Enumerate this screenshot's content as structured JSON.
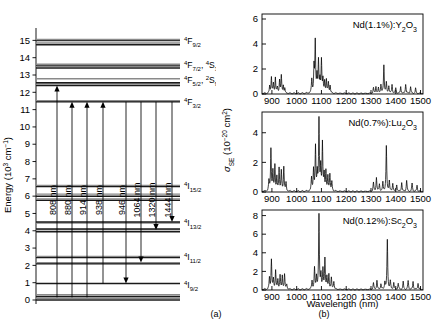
{
  "figure": {
    "panel_a_caption": "(a)",
    "panel_b_caption": "(b)"
  },
  "panel_a": {
    "name": "nd-energy-level-diagram",
    "ylabel": "Energy (10³ cm⁻¹)",
    "ylim": [
      0,
      15.6
    ],
    "yticks": [
      0,
      1,
      2,
      3,
      4,
      5,
      6,
      7,
      8,
      9,
      10,
      11,
      12,
      13,
      14,
      15
    ],
    "manifolds": [
      {
        "label": "⁴F₉₁₂",
        "label_text": "4F9/2",
        "sup": "4",
        "term": "F",
        "sub": "9/2",
        "levels": [
          14.75,
          14.85,
          15.0,
          15.05
        ]
      },
      {
        "label": "4F7/2, 4S3/2",
        "sup": "4",
        "term": "F",
        "sub": "7/2",
        "sup2": "4",
        "term2": "S",
        "sub2": "3/2",
        "levels": [
          13.4,
          13.5,
          13.58,
          13.62
        ]
      },
      {
        "label": "4F5/2, 2S9/2",
        "sup": "4",
        "term": "F",
        "sub": "5/2",
        "sup2": "2",
        "term2": "S",
        "sub2": "9/2",
        "levels": [
          12.4,
          12.48,
          12.55,
          12.78
        ]
      },
      {
        "label": "4F3/2",
        "sup": "4",
        "term": "F",
        "sub": "3/2",
        "levels": [
          11.45,
          11.52
        ]
      },
      {
        "label": "4I15/2",
        "sup": "4",
        "term": "I",
        "sub": "15/2",
        "levels": [
          5.76,
          5.84,
          6.0,
          6.12,
          6.56,
          6.62
        ]
      },
      {
        "label": "4I13/2",
        "sup": "4",
        "term": "I",
        "sub": "13/2",
        "levels": [
          3.95,
          4.05,
          4.1,
          4.45,
          4.5
        ]
      },
      {
        "label": "4I11/2",
        "sup": "4",
        "term": "I",
        "sub": "11/2",
        "levels": [
          2.1,
          2.16,
          2.45,
          2.52
        ]
      },
      {
        "label": "4I9/2",
        "sup": "4",
        "term": "I",
        "sub": "9/2",
        "levels": [
          0.0,
          0.1,
          0.2,
          0.3,
          0.95
        ]
      }
    ],
    "transitions": [
      {
        "label": "808 nm",
        "direction": "up",
        "x": 57,
        "from": 0.15,
        "to": 12.4
      },
      {
        "label": "880 nm",
        "direction": "up",
        "x": 72,
        "from": 0.15,
        "to": 11.45
      },
      {
        "label": "914 nm",
        "direction": "up",
        "x": 87,
        "from": 0.15,
        "to": 11.45
      },
      {
        "label": "938 nm",
        "direction": "up",
        "x": 103,
        "from": 0.95,
        "to": 11.45
      },
      {
        "label": "946 nm",
        "direction": "down",
        "x": 126,
        "from": 11.45,
        "to": 0.95
      },
      {
        "label": "1064 nm",
        "direction": "down",
        "x": 141,
        "from": 11.45,
        "to": 2.16
      },
      {
        "label": "1320 nm",
        "direction": "down",
        "x": 156,
        "from": 11.45,
        "to": 4.05
      },
      {
        "label": "1444 nm",
        "direction": "down",
        "x": 172,
        "from": 11.45,
        "to": 4.5
      }
    ]
  },
  "panel_b": {
    "name": "emission-cross-section-spectra",
    "xlabel": "Wavelength (nm)",
    "ylabel": "σ_SE (10⁻²⁰ cm²)",
    "ylabel_parts": {
      "sym": "σ",
      "sub": "SE",
      "unit_pre": " (10",
      "unit_exp": "−20",
      "unit_post": " cm",
      "unit_sq": "2",
      "unit_close": ")"
    },
    "xlim": [
      860,
      1510
    ],
    "xticks": [
      900,
      1000,
      1100,
      1200,
      1300,
      1400,
      1500
    ],
    "subplots": [
      {
        "name": "spectrum-y2o3",
        "title": "Nd(1.1%):Y₂O₃",
        "title_parts": [
          {
            "t": "Nd(1.1%):Y"
          },
          {
            "t": "2",
            "sub": true
          },
          {
            "t": "O"
          },
          {
            "t": "3",
            "sub": true
          }
        ],
        "ylim": [
          0,
          6.4
        ],
        "yticks": [
          0,
          2,
          4,
          6
        ]
      },
      {
        "name": "spectrum-lu2o3",
        "title": "Nd(0.7%):Lu₂O₃",
        "title_parts": [
          {
            "t": "Nd(0.7%):Lu"
          },
          {
            "t": "2",
            "sub": true
          },
          {
            "t": "O"
          },
          {
            "t": "3",
            "sub": true
          }
        ],
        "ylim": [
          0,
          5.4
        ],
        "yticks": [
          0,
          2,
          4
        ]
      },
      {
        "name": "spectrum-sc2o3",
        "title": "Nd(0.12%):Sc₂O₃",
        "title_parts": [
          {
            "t": "Nd(0.12%):Sc"
          },
          {
            "t": "2",
            "sub": true
          },
          {
            "t": "O"
          },
          {
            "t": "3",
            "sub": true
          }
        ],
        "ylim": [
          0,
          8.6
        ],
        "yticks": [
          0,
          2,
          4,
          6,
          8
        ]
      }
    ]
  },
  "chart_data": [
    {
      "type": "line",
      "name": "Nd(1.1%):Y2O3 stimulated emission cross section",
      "title": "Nd(1.1%):Y2O3",
      "xlabel": "Wavelength (nm)",
      "ylabel": "sigma_SE (10^-20 cm^2)",
      "xlim": [
        860,
        1510
      ],
      "ylim": [
        0,
        6.4
      ],
      "xticks": [
        900,
        1000,
        1100,
        1200,
        1300,
        1400,
        1500
      ],
      "yticks": [
        0,
        2,
        4,
        6
      ],
      "peaks": [
        {
          "x": 891,
          "y": 0.55
        },
        {
          "x": 898,
          "y": 1.3
        },
        {
          "x": 906,
          "y": 0.75
        },
        {
          "x": 914,
          "y": 1.25
        },
        {
          "x": 922,
          "y": 0.45
        },
        {
          "x": 931,
          "y": 1.05
        },
        {
          "x": 938,
          "y": 1.4
        },
        {
          "x": 946,
          "y": 0.6
        },
        {
          "x": 952,
          "y": 0.35
        },
        {
          "x": 1061,
          "y": 1.1
        },
        {
          "x": 1070,
          "y": 2.05
        },
        {
          "x": 1075,
          "y": 4.0
        },
        {
          "x": 1082,
          "y": 1.35
        },
        {
          "x": 1088,
          "y": 2.55
        },
        {
          "x": 1094,
          "y": 1.0
        },
        {
          "x": 1100,
          "y": 2.65
        },
        {
          "x": 1106,
          "y": 1.05
        },
        {
          "x": 1113,
          "y": 0.9
        },
        {
          "x": 1120,
          "y": 1.05
        },
        {
          "x": 1128,
          "y": 0.85
        },
        {
          "x": 1135,
          "y": 0.6
        },
        {
          "x": 1310,
          "y": 0.45
        },
        {
          "x": 1320,
          "y": 0.55
        },
        {
          "x": 1330,
          "y": 0.4
        },
        {
          "x": 1340,
          "y": 0.7
        },
        {
          "x": 1352,
          "y": 2.25
        },
        {
          "x": 1362,
          "y": 0.85
        },
        {
          "x": 1372,
          "y": 0.6
        },
        {
          "x": 1385,
          "y": 0.7
        },
        {
          "x": 1400,
          "y": 0.45
        },
        {
          "x": 1420,
          "y": 0.55
        },
        {
          "x": 1440,
          "y": 0.75
        },
        {
          "x": 1460,
          "y": 0.55
        },
        {
          "x": 1480,
          "y": 0.4
        }
      ]
    },
    {
      "type": "line",
      "name": "Nd(0.7%):Lu2O3 stimulated emission cross section",
      "title": "Nd(0.7%):Lu2O3",
      "xlabel": "Wavelength (nm)",
      "ylabel": "sigma_SE (10^-20 cm^2)",
      "xlim": [
        860,
        1510
      ],
      "ylim": [
        0,
        5.4
      ],
      "xticks": [
        900,
        1000,
        1100,
        1200,
        1300,
        1400,
        1500
      ],
      "yticks": [
        0,
        2,
        4
      ],
      "peaks": [
        {
          "x": 888,
          "y": 0.7
        },
        {
          "x": 896,
          "y": 2.85
        },
        {
          "x": 904,
          "y": 1.3
        },
        {
          "x": 912,
          "y": 1.75
        },
        {
          "x": 920,
          "y": 0.9
        },
        {
          "x": 929,
          "y": 1.55
        },
        {
          "x": 938,
          "y": 1.35
        },
        {
          "x": 948,
          "y": 1.65
        },
        {
          "x": 957,
          "y": 0.55
        },
        {
          "x": 1060,
          "y": 0.9
        },
        {
          "x": 1068,
          "y": 1.45
        },
        {
          "x": 1076,
          "y": 2.95
        },
        {
          "x": 1083,
          "y": 1.2
        },
        {
          "x": 1090,
          "y": 4.75
        },
        {
          "x": 1097,
          "y": 1.55
        },
        {
          "x": 1104,
          "y": 3.2
        },
        {
          "x": 1111,
          "y": 1.1
        },
        {
          "x": 1118,
          "y": 1.35
        },
        {
          "x": 1126,
          "y": 0.95
        },
        {
          "x": 1134,
          "y": 1.15
        },
        {
          "x": 1142,
          "y": 0.6
        },
        {
          "x": 1310,
          "y": 0.6
        },
        {
          "x": 1322,
          "y": 0.95
        },
        {
          "x": 1334,
          "y": 0.5
        },
        {
          "x": 1348,
          "y": 0.6
        },
        {
          "x": 1362,
          "y": 3.05
        },
        {
          "x": 1374,
          "y": 0.7
        },
        {
          "x": 1388,
          "y": 0.55
        },
        {
          "x": 1404,
          "y": 0.45
        },
        {
          "x": 1424,
          "y": 0.6
        },
        {
          "x": 1444,
          "y": 0.75
        },
        {
          "x": 1466,
          "y": 0.55
        },
        {
          "x": 1486,
          "y": 0.4
        }
      ]
    },
    {
      "type": "line",
      "name": "Nd(0.12%):Sc2O3 stimulated emission cross section",
      "title": "Nd(0.12%):Sc2O3",
      "xlabel": "Wavelength (nm)",
      "ylabel": "sigma_SE (10^-20 cm^2)",
      "xlim": [
        860,
        1510
      ],
      "ylim": [
        0,
        8.6
      ],
      "xticks": [
        900,
        1000,
        1100,
        1200,
        1300,
        1400,
        1500
      ],
      "yticks": [
        0,
        2,
        4,
        6,
        8
      ],
      "peaks": [
        {
          "x": 890,
          "y": 1.2
        },
        {
          "x": 898,
          "y": 3.2
        },
        {
          "x": 906,
          "y": 1.05
        },
        {
          "x": 915,
          "y": 2.05
        },
        {
          "x": 924,
          "y": 0.95
        },
        {
          "x": 933,
          "y": 1.55
        },
        {
          "x": 942,
          "y": 1.4
        },
        {
          "x": 951,
          "y": 1.6
        },
        {
          "x": 960,
          "y": 0.55
        },
        {
          "x": 1062,
          "y": 0.9
        },
        {
          "x": 1072,
          "y": 2.3
        },
        {
          "x": 1080,
          "y": 1.3
        },
        {
          "x": 1090,
          "y": 7.95
        },
        {
          "x": 1098,
          "y": 1.55
        },
        {
          "x": 1106,
          "y": 2.1
        },
        {
          "x": 1114,
          "y": 3.25
        },
        {
          "x": 1122,
          "y": 1.3
        },
        {
          "x": 1130,
          "y": 1.55
        },
        {
          "x": 1140,
          "y": 1.2
        },
        {
          "x": 1150,
          "y": 0.85
        },
        {
          "x": 1310,
          "y": 0.7
        },
        {
          "x": 1324,
          "y": 0.95
        },
        {
          "x": 1340,
          "y": 0.6
        },
        {
          "x": 1356,
          "y": 0.8
        },
        {
          "x": 1366,
          "y": 5.35
        },
        {
          "x": 1378,
          "y": 0.9
        },
        {
          "x": 1392,
          "y": 0.7
        },
        {
          "x": 1410,
          "y": 0.65
        },
        {
          "x": 1430,
          "y": 0.8
        },
        {
          "x": 1450,
          "y": 0.95
        },
        {
          "x": 1470,
          "y": 0.85
        },
        {
          "x": 1490,
          "y": 0.7
        }
      ]
    }
  ]
}
